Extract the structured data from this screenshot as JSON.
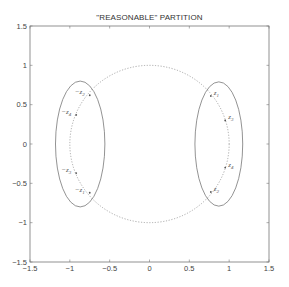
{
  "chart_data": {
    "type": "scatter",
    "title": "\"REASONABLE\" PARTITION",
    "xlabel": "",
    "ylabel": "",
    "xlim": [
      -1.5,
      1.5
    ],
    "ylim": [
      -1.5,
      1.5
    ],
    "grid": false,
    "x_ticks": [
      "-1.5",
      "-1",
      "-0.5",
      "0",
      "0.5",
      "1",
      "1.5"
    ],
    "y_ticks": [
      "1.5",
      "1",
      "0.5",
      "0",
      "-0.5",
      "-1",
      "-1.5"
    ],
    "unit_circle": {
      "style": "dotted",
      "center": [
        0,
        0
      ],
      "radius": 1
    },
    "ellipses": [
      {
        "name": "left-cluster",
        "center": [
          -0.87,
          0.0
        ],
        "rx": 0.31,
        "ry": 0.8,
        "style": "solid"
      },
      {
        "name": "right-cluster",
        "center": [
          0.87,
          0.0
        ],
        "rx": 0.3,
        "ry": 0.79,
        "style": "solid"
      }
    ],
    "points": [
      {
        "label": "-z2",
        "base": "-z",
        "sub": "2",
        "x": -0.75,
        "y": 0.62
      },
      {
        "label": "-z4",
        "base": "-z",
        "sub": "4",
        "x": -0.92,
        "y": 0.37
      },
      {
        "label": "-z3",
        "base": "-z",
        "sub": "3",
        "x": -0.92,
        "y": -0.37
      },
      {
        "label": "-z1",
        "base": "-z",
        "sub": "1",
        "x": -0.75,
        "y": -0.62
      },
      {
        "label": "z1",
        "base": "z",
        "sub": "1",
        "x": 0.77,
        "y": 0.61
      },
      {
        "label": "z3",
        "base": "z",
        "sub": "3",
        "x": 0.95,
        "y": 0.3
      },
      {
        "label": "z4",
        "base": "z",
        "sub": "4",
        "x": 0.95,
        "y": -0.3
      },
      {
        "label": "z2",
        "base": "z",
        "sub": "2",
        "x": 0.77,
        "y": -0.61
      }
    ]
  }
}
